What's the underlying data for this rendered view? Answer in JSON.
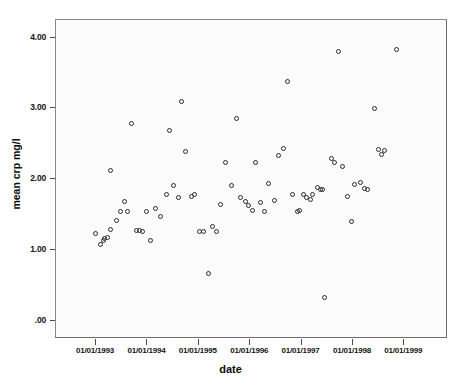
{
  "chart_data": {
    "type": "scatter",
    "title": "",
    "xlabel": "date",
    "ylabel": "mean crp mg/l",
    "grid": false,
    "legend": null,
    "ytick_labels": [
      "4.00",
      "3.00",
      "2.00",
      "1.00",
      ".00"
    ],
    "ytick_values": [
      4.0,
      3.0,
      2.0,
      1.0,
      0.0
    ],
    "ylim": [
      -0.26,
      4.25
    ],
    "xtick_labels": [
      "01/01/1993",
      "01/01/1994",
      "01/01/1995",
      "01/01/1996",
      "01/01/1997",
      "01/01/1998",
      "01/01/1999"
    ],
    "xtick_values": [
      1993.0,
      1994.0,
      1995.0,
      1996.0,
      1997.0,
      1998.0,
      1999.0
    ],
    "xlim": [
      1992.22,
      1999.85
    ],
    "marker": "open-circle",
    "marker_color": "#2b2b2b",
    "series": [
      {
        "name": "mean crp mg/l",
        "points": [
          {
            "x": 1992.99,
            "y": 1.22
          },
          {
            "x": 1993.09,
            "y": 1.07
          },
          {
            "x": 1993.15,
            "y": 1.13
          },
          {
            "x": 1993.18,
            "y": 1.16
          },
          {
            "x": 1993.23,
            "y": 1.17
          },
          {
            "x": 1993.29,
            "y": 1.28
          },
          {
            "x": 1993.3,
            "y": 2.11
          },
          {
            "x": 1993.4,
            "y": 1.41
          },
          {
            "x": 1993.49,
            "y": 1.53
          },
          {
            "x": 1993.56,
            "y": 1.68
          },
          {
            "x": 1993.63,
            "y": 1.53
          },
          {
            "x": 1993.7,
            "y": 2.78
          },
          {
            "x": 1993.79,
            "y": 1.26
          },
          {
            "x": 1993.85,
            "y": 1.26
          },
          {
            "x": 1993.92,
            "y": 1.25
          },
          {
            "x": 1994.0,
            "y": 1.54
          },
          {
            "x": 1994.07,
            "y": 1.12
          },
          {
            "x": 1994.17,
            "y": 1.58
          },
          {
            "x": 1994.27,
            "y": 1.47
          },
          {
            "x": 1994.39,
            "y": 1.77
          },
          {
            "x": 1994.44,
            "y": 2.68
          },
          {
            "x": 1994.51,
            "y": 1.9
          },
          {
            "x": 1994.62,
            "y": 1.73
          },
          {
            "x": 1994.68,
            "y": 3.09
          },
          {
            "x": 1994.75,
            "y": 2.39
          },
          {
            "x": 1994.86,
            "y": 1.75
          },
          {
            "x": 1994.92,
            "y": 1.78
          },
          {
            "x": 1995.02,
            "y": 1.25
          },
          {
            "x": 1995.1,
            "y": 1.25
          },
          {
            "x": 1995.19,
            "y": 0.66
          },
          {
            "x": 1995.27,
            "y": 1.33
          },
          {
            "x": 1995.36,
            "y": 1.25
          },
          {
            "x": 1995.43,
            "y": 1.64
          },
          {
            "x": 1995.52,
            "y": 2.23
          },
          {
            "x": 1995.64,
            "y": 1.9
          },
          {
            "x": 1995.75,
            "y": 2.85
          },
          {
            "x": 1995.83,
            "y": 1.74
          },
          {
            "x": 1995.92,
            "y": 1.68
          },
          {
            "x": 1995.98,
            "y": 1.62
          },
          {
            "x": 1996.05,
            "y": 1.55
          },
          {
            "x": 1996.12,
            "y": 2.23
          },
          {
            "x": 1996.21,
            "y": 1.66
          },
          {
            "x": 1996.29,
            "y": 1.53
          },
          {
            "x": 1996.37,
            "y": 1.93
          },
          {
            "x": 1996.48,
            "y": 1.69
          },
          {
            "x": 1996.56,
            "y": 2.33
          },
          {
            "x": 1996.65,
            "y": 2.42
          },
          {
            "x": 1996.73,
            "y": 3.38
          },
          {
            "x": 1996.83,
            "y": 1.77
          },
          {
            "x": 1996.93,
            "y": 1.54
          },
          {
            "x": 1996.97,
            "y": 1.55
          },
          {
            "x": 1997.05,
            "y": 1.77
          },
          {
            "x": 1997.1,
            "y": 1.74
          },
          {
            "x": 1997.18,
            "y": 1.7
          },
          {
            "x": 1997.23,
            "y": 1.78
          },
          {
            "x": 1997.31,
            "y": 1.88
          },
          {
            "x": 1997.37,
            "y": 1.85
          },
          {
            "x": 1997.42,
            "y": 1.85
          },
          {
            "x": 1997.45,
            "y": 0.32
          },
          {
            "x": 1997.6,
            "y": 2.29
          },
          {
            "x": 1997.66,
            "y": 2.23
          },
          {
            "x": 1997.73,
            "y": 3.8
          },
          {
            "x": 1997.8,
            "y": 2.17
          },
          {
            "x": 1997.9,
            "y": 1.75
          },
          {
            "x": 1997.99,
            "y": 1.39
          },
          {
            "x": 1998.04,
            "y": 1.92
          },
          {
            "x": 1998.16,
            "y": 1.95
          },
          {
            "x": 1998.24,
            "y": 1.86
          },
          {
            "x": 1998.3,
            "y": 1.84
          },
          {
            "x": 1998.42,
            "y": 2.99
          },
          {
            "x": 1998.5,
            "y": 2.41
          },
          {
            "x": 1998.56,
            "y": 2.34
          },
          {
            "x": 1998.62,
            "y": 2.4
          },
          {
            "x": 1998.86,
            "y": 3.83
          }
        ]
      }
    ]
  }
}
